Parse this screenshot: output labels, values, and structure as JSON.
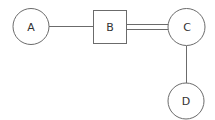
{
  "diagram": {
    "nodes": [
      {
        "id": "A",
        "label": "A",
        "shape": "circle"
      },
      {
        "id": "B",
        "label": "B",
        "shape": "square"
      },
      {
        "id": "C",
        "label": "C",
        "shape": "circle"
      },
      {
        "id": "D",
        "label": "D",
        "shape": "circle"
      }
    ],
    "edges": [
      {
        "from": "A",
        "to": "B",
        "style": "single"
      },
      {
        "from": "B",
        "to": "C",
        "style": "double"
      },
      {
        "from": "C",
        "to": "D",
        "style": "single"
      }
    ],
    "colors": {
      "stroke": "#6b6b6b",
      "text": "#333333",
      "background": "#ffffff"
    }
  }
}
